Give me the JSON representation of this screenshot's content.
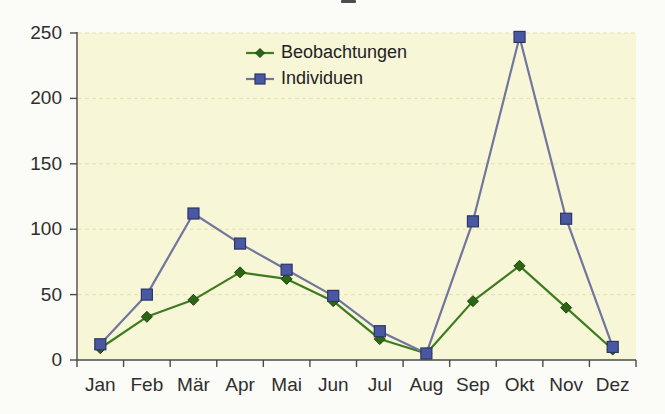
{
  "chart_data": {
    "type": "line",
    "title": "",
    "xlabel": "",
    "ylabel": "",
    "categories": [
      "Jan",
      "Feb",
      "Mär",
      "Apr",
      "Mai",
      "Jun",
      "Jul",
      "Aug",
      "Sep",
      "Okt",
      "Nov",
      "Dez"
    ],
    "series": [
      {
        "name": "Beobachtungen",
        "values": [
          9,
          33,
          46,
          67,
          62,
          45,
          16,
          5,
          45,
          72,
          40,
          8
        ],
        "color": "#3e7a1f",
        "marker": "diamond",
        "marker_fill": "#2c6614",
        "marker_stroke": "#1c450c"
      },
      {
        "name": "Individuen",
        "values": [
          12,
          50,
          112,
          89,
          69,
          49,
          22,
          5,
          106,
          247,
          108,
          10
        ],
        "color": "#72769c",
        "marker": "square",
        "marker_fill": "#4a58a4",
        "marker_stroke": "#2c3664"
      }
    ],
    "ylim": [
      0,
      250
    ],
    "yticks": [
      0,
      50,
      100,
      150,
      200,
      250
    ],
    "grid": "horizontal-dashed",
    "legend_position": "top-center-inside",
    "plot_bg": "#f7f6d7",
    "grid_color": "#e3e2ae",
    "axis_color": "#4a4a4a",
    "tick_label_color": "#2e2e2e"
  }
}
